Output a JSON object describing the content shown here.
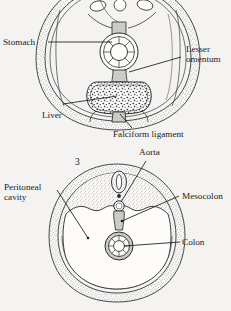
{
  "figure": {
    "background_color": "#f4f3f1",
    "ink_color": "#1a1a1a",
    "figure_number": "3"
  },
  "panels": [
    {
      "id": "upper-panel",
      "name": "upper-abdominal-cross-section",
      "description": "Transverse section through upper abdomen showing stomach, liver, lesser omentum and falciform ligament",
      "labels": [
        {
          "name": "stomach",
          "text": "Stomach",
          "lines": [
            "Stomach"
          ]
        },
        {
          "name": "lesser-omentum",
          "text": "Lesser omentum",
          "lines": [
            "Lesser",
            "omentum"
          ]
        },
        {
          "name": "liver",
          "text": "Liver",
          "lines": [
            "Liver"
          ]
        },
        {
          "name": "falciform-ligament",
          "text": "Falciform ligament",
          "lines": [
            "Falciform ligament"
          ]
        }
      ]
    },
    {
      "id": "lower-panel",
      "name": "lower-abdominal-cross-section",
      "description": "Transverse section through lower abdomen showing aorta, mesocolon, colon and peritoneal cavity",
      "labels": [
        {
          "name": "aorta",
          "text": "Aorta",
          "lines": [
            "Aorta"
          ]
        },
        {
          "name": "peritoneal-cavity",
          "text": "Peritoneal cavity",
          "lines": [
            "Peritoneal",
            "cavity"
          ]
        },
        {
          "name": "mesocolon",
          "text": "Mesocolon",
          "lines": [
            "Mesocolon"
          ]
        },
        {
          "name": "colon",
          "text": "Colon",
          "lines": [
            "Colon"
          ]
        }
      ]
    }
  ],
  "text": {
    "stomach": "Stomach",
    "lesser_omentum_1": "Lesser",
    "lesser_omentum_2": "omentum",
    "liver": "Liver",
    "falciform_ligament": "Falciform ligament",
    "aorta": "Aorta",
    "peritoneal_1": "Peritoneal",
    "peritoneal_2": "cavity",
    "mesocolon": "Mesocolon",
    "colon": "Colon",
    "fig_number": "3"
  }
}
